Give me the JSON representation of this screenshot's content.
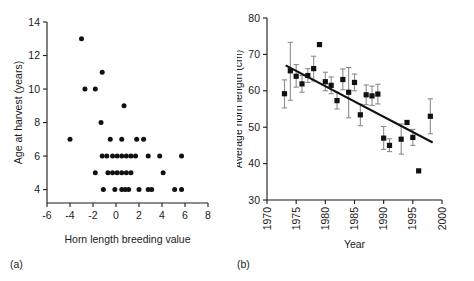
{
  "figure": {
    "panels": [
      {
        "key": "a",
        "label": "(a)",
        "chart_data": {
          "type": "scatter",
          "title": "",
          "xlabel": "Horn length breeding value",
          "ylabel": "Age at harvest (years)",
          "xlim": [
            -6,
            8
          ],
          "ylim": [
            3.2,
            14
          ],
          "xticks": [
            -6,
            -4,
            -2,
            0,
            2,
            4,
            6,
            8
          ],
          "yticks": [
            4,
            6,
            8,
            10,
            12,
            14
          ],
          "xtick_labels": [
            "-6",
            "-4",
            "-2",
            "0",
            "2",
            "4",
            "6",
            "8"
          ],
          "ytick_labels": [
            "4",
            "6",
            "8",
            "10",
            "12",
            "14"
          ],
          "grid": false,
          "legend": "none",
          "marker": "filled-circle",
          "points": [
            {
              "x": -3.0,
              "y": 13.0
            },
            {
              "x": -1.2,
              "y": 11.0
            },
            {
              "x": -2.7,
              "y": 10.0
            },
            {
              "x": -1.8,
              "y": 10.0
            },
            {
              "x": 0.7,
              "y": 9.0
            },
            {
              "x": -1.3,
              "y": 8.0
            },
            {
              "x": -4.0,
              "y": 7.0
            },
            {
              "x": -0.5,
              "y": 7.0
            },
            {
              "x": 0.5,
              "y": 7.0
            },
            {
              "x": 1.8,
              "y": 7.0
            },
            {
              "x": 2.4,
              "y": 7.0
            },
            {
              "x": -1.2,
              "y": 6.0
            },
            {
              "x": -0.8,
              "y": 6.0
            },
            {
              "x": -0.3,
              "y": 6.0
            },
            {
              "x": 0.1,
              "y": 6.0
            },
            {
              "x": 0.5,
              "y": 6.0
            },
            {
              "x": 0.9,
              "y": 6.0
            },
            {
              "x": 1.3,
              "y": 6.0
            },
            {
              "x": 1.7,
              "y": 6.0
            },
            {
              "x": 2.8,
              "y": 6.0
            },
            {
              "x": 3.8,
              "y": 6.0
            },
            {
              "x": 5.7,
              "y": 6.0
            },
            {
              "x": -1.8,
              "y": 5.0
            },
            {
              "x": -0.7,
              "y": 5.0
            },
            {
              "x": -0.3,
              "y": 5.0
            },
            {
              "x": 0.1,
              "y": 5.0
            },
            {
              "x": 0.5,
              "y": 5.0
            },
            {
              "x": 0.9,
              "y": 5.0
            },
            {
              "x": 1.3,
              "y": 5.0
            },
            {
              "x": 4.1,
              "y": 5.0
            },
            {
              "x": -1.1,
              "y": 4.0
            },
            {
              "x": -0.1,
              "y": 4.0
            },
            {
              "x": 0.5,
              "y": 4.0
            },
            {
              "x": 0.8,
              "y": 4.0
            },
            {
              "x": 1.1,
              "y": 4.0
            },
            {
              "x": 2.0,
              "y": 4.0
            },
            {
              "x": 2.8,
              "y": 4.0
            },
            {
              "x": 3.1,
              "y": 4.0
            },
            {
              "x": 5.1,
              "y": 4.0
            },
            {
              "x": 5.7,
              "y": 4.0
            }
          ]
        }
      },
      {
        "key": "b",
        "label": "(b)",
        "chart_data": {
          "type": "scatter",
          "title": "",
          "xlabel": "Year",
          "ylabel": "Average horn length (cm)",
          "xlim": [
            1970,
            2000
          ],
          "ylim": [
            30,
            80
          ],
          "xticks": [
            1970,
            1975,
            1980,
            1985,
            1990,
            1995,
            2000
          ],
          "yticks": [
            30,
            40,
            50,
            60,
            70,
            80
          ],
          "xtick_labels": [
            "1970",
            "1975",
            "1980",
            "1985",
            "1990",
            "1995",
            "2000"
          ],
          "ytick_labels": [
            "30",
            "40",
            "50",
            "60",
            "70",
            "80"
          ],
          "grid": false,
          "legend": "none",
          "marker": "filled-square",
          "errorbars": true,
          "points": [
            {
              "x": 1973,
              "y": 59.2,
              "yerr_low": 55.3,
              "yerr_high": 63.0
            },
            {
              "x": 1974,
              "y": 65.5,
              "yerr_low": 57.4,
              "yerr_high": 73.3
            },
            {
              "x": 1975,
              "y": 64.0,
              "yerr_low": 61.0,
              "yerr_high": 67.2
            },
            {
              "x": 1976,
              "y": 61.9,
              "yerr_low": 59.6,
              "yerr_high": 64.2
            },
            {
              "x": 1977,
              "y": 64.2,
              "yerr_low": 62.3,
              "yerr_high": 66.1
            },
            {
              "x": 1978,
              "y": 66.1,
              "yerr_low": 62.7,
              "yerr_high": 69.5
            },
            {
              "x": 1979,
              "y": 72.7,
              "yerr_low": 72.7,
              "yerr_high": 72.7
            },
            {
              "x": 1980,
              "y": 62.5,
              "yerr_low": 60.0,
              "yerr_high": 65.1
            },
            {
              "x": 1981,
              "y": 61.5,
              "yerr_low": 59.2,
              "yerr_high": 63.8
            },
            {
              "x": 1982,
              "y": 57.3,
              "yerr_low": 55.0,
              "yerr_high": 59.6
            },
            {
              "x": 1983,
              "y": 63.1,
              "yerr_low": 60.3,
              "yerr_high": 66.0
            },
            {
              "x": 1984,
              "y": 59.6,
              "yerr_low": 52.6,
              "yerr_high": 66.4
            },
            {
              "x": 1985,
              "y": 62.3,
              "yerr_low": 60.0,
              "yerr_high": 64.6
            },
            {
              "x": 1986,
              "y": 53.4,
              "yerr_low": 50.4,
              "yerr_high": 56.3
            },
            {
              "x": 1987,
              "y": 58.9,
              "yerr_low": 56.2,
              "yerr_high": 61.6
            },
            {
              "x": 1988,
              "y": 58.6,
              "yerr_low": 56.0,
              "yerr_high": 61.3
            },
            {
              "x": 1989,
              "y": 59.1,
              "yerr_low": 56.4,
              "yerr_high": 61.8
            },
            {
              "x": 1990,
              "y": 47.0,
              "yerr_low": 43.9,
              "yerr_high": 50.2
            },
            {
              "x": 1991,
              "y": 45.0,
              "yerr_low": 43.3,
              "yerr_high": 46.8
            },
            {
              "x": 1993,
              "y": 46.7,
              "yerr_low": 42.6,
              "yerr_high": 50.9
            },
            {
              "x": 1994,
              "y": 51.3,
              "yerr_low": 51.3,
              "yerr_high": 51.3
            },
            {
              "x": 1995,
              "y": 47.2,
              "yerr_low": 45.0,
              "yerr_high": 49.4
            },
            {
              "x": 1996,
              "y": 38.0,
              "yerr_low": 38.0,
              "yerr_high": 38.0
            },
            {
              "x": 1998,
              "y": 53.0,
              "yerr_low": 48.2,
              "yerr_high": 57.8
            }
          ],
          "trendline": {
            "x_start": 1973.2,
            "y_start": 67.0,
            "x_end": 1998.4,
            "y_end": 45.8
          }
        }
      }
    ]
  }
}
